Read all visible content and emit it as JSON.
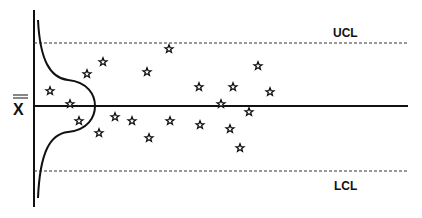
{
  "chart_data": {
    "type": "scatter",
    "title": "",
    "subtitle": "Control chart (X-bar) with normal distribution overlay",
    "xlabel": "",
    "ylabel": "X̿",
    "center_line": {
      "label": "X̿",
      "y": 0
    },
    "ucl": {
      "label": "UCL",
      "y": 3
    },
    "lcl": {
      "label": "LCL",
      "y": -3
    },
    "ylim": [
      -4.1,
      4.1
    ],
    "grid": false,
    "legend": "none",
    "marker": "star",
    "series": [
      {
        "name": "samples",
        "x": [
          1,
          2,
          3,
          4,
          5,
          6,
          7,
          8,
          9,
          10,
          11,
          12,
          13,
          14,
          15,
          16,
          17,
          18,
          19,
          20,
          21
        ],
        "values": [
          0.6,
          0.0,
          -0.8,
          1.4,
          1.9,
          -1.3,
          -0.6,
          -0.8,
          1.5,
          -1.5,
          2.5,
          -0.8,
          0.8,
          -0.9,
          0.0,
          -1.1,
          0.8,
          -2.0,
          -0.4,
          1.7,
          0.6
        ]
      }
    ],
    "points_px": [
      [
        50,
        91
      ],
      [
        70,
        104
      ],
      [
        79,
        121
      ],
      [
        87,
        74
      ],
      [
        103,
        62
      ],
      [
        99,
        133
      ],
      [
        115,
        117
      ],
      [
        132,
        121
      ],
      [
        147,
        72
      ],
      [
        149,
        138
      ],
      [
        169,
        49
      ],
      [
        170,
        121
      ],
      [
        199,
        87
      ],
      [
        200,
        125
      ],
      [
        221,
        104
      ],
      [
        230,
        129
      ],
      [
        233,
        87
      ],
      [
        240,
        148
      ],
      [
        249,
        112
      ],
      [
        258,
        66
      ],
      [
        270,
        92
      ]
    ],
    "distribution_overlay": "normal curve drawn sideways along the y-axis"
  },
  "labels": {
    "ucl": "UCL",
    "lcl": "LCL",
    "center": "X"
  }
}
